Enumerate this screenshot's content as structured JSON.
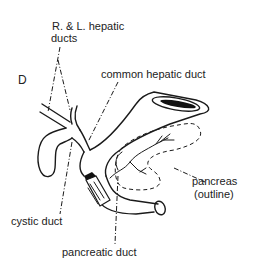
{
  "figure": {
    "panel_letter": "D",
    "labels": {
      "hepatic_ducts_line1": "R. & L. hepatic",
      "hepatic_ducts_line2": "ducts",
      "common_hepatic_duct": "common hepatic duct",
      "pancreas_line1": "pancreas",
      "pancreas_line2": "(outline)",
      "cystic_duct": "cystic duct",
      "pancreatic_duct": "pancreatic duct"
    },
    "colors": {
      "ink": "#1a1a1a",
      "background": "#ffffff"
    }
  }
}
